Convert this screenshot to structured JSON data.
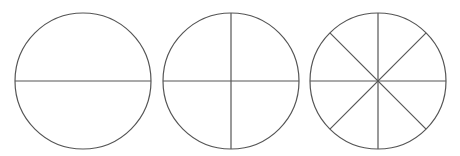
{
  "diagram": {
    "stroke_color": "#555555",
    "circles": [
      {
        "name": "halves",
        "cx": 83,
        "cy": 81,
        "r": 68,
        "divisions": 2
      },
      {
        "name": "quarters",
        "cx": 231,
        "cy": 81,
        "r": 68,
        "divisions": 4
      },
      {
        "name": "eighths",
        "cx": 378,
        "cy": 81,
        "r": 68,
        "divisions": 8
      }
    ]
  }
}
